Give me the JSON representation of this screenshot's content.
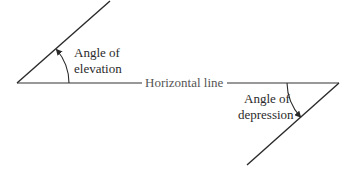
{
  "diagram": {
    "elevation": {
      "label_line1": "Angle of",
      "label_line2": "elevation"
    },
    "horizontal": {
      "label": "Horizontal line"
    },
    "depression": {
      "label_line1": "Angle of",
      "label_line2": "depression"
    },
    "colors": {
      "line": "#2a2a2a",
      "background": "#ffffff"
    }
  }
}
